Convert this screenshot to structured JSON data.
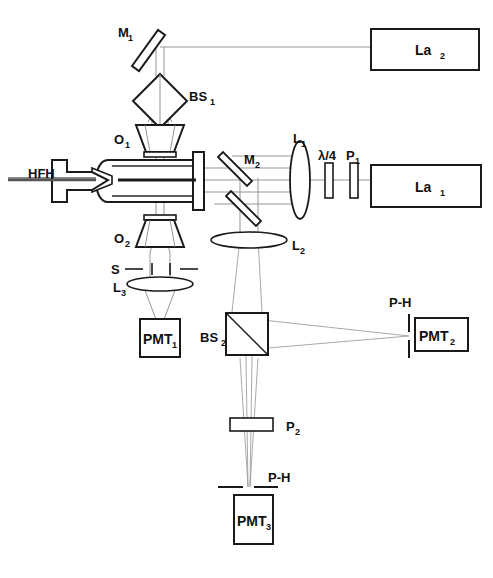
{
  "figure": {
    "type": "optical-schematic",
    "width": 493,
    "height": 578,
    "background_color": "#ffffff",
    "line_color": "#1a1a1a",
    "ray_color": "#9a9a9a"
  },
  "components": {
    "hfh": {
      "label": "HFH",
      "name": "hydrodynamic-focusing-head",
      "label_x": 28,
      "label_y": 178
    },
    "mirror_1": {
      "label": "M",
      "sub": "1",
      "name": "mirror-1",
      "label_x": 118,
      "label_y": 37
    },
    "mirror_2": {
      "label": "M",
      "sub": "2",
      "name": "mirror-2",
      "label_x": 244,
      "label_y": 164
    },
    "beamsplitter_1": {
      "label": "BS",
      "sub": "1",
      "name": "beam-splitter-1",
      "label_x": 189,
      "label_y": 101
    },
    "beamsplitter_2": {
      "label": "BS",
      "sub": "2",
      "name": "beam-splitter-2",
      "label_x": 203,
      "label_y": 342
    },
    "objective_1": {
      "label": "O",
      "sub": "1",
      "name": "objective-1",
      "label_x": 114,
      "label_y": 144
    },
    "objective_2": {
      "label": "O",
      "sub": "2",
      "name": "objective-2",
      "label_x": 114,
      "label_y": 243
    },
    "lens_1": {
      "label": "L",
      "sub": "1",
      "name": "lens-1",
      "label_x": 295,
      "label_y": 143
    },
    "lens_2": {
      "label": "L",
      "sub": "2",
      "name": "lens-2",
      "label_x": 296,
      "label_y": 248
    },
    "lens_3": {
      "label": "L",
      "sub": "3",
      "name": "lens-3",
      "label_x": 116,
      "label_y": 289
    },
    "slit": {
      "label": "S",
      "name": "slit",
      "label_x": 111,
      "label_y": 271
    },
    "quarter_wave_plate": {
      "label": "λ/4",
      "name": "quarter-wave-plate",
      "label_x": 320,
      "label_y": 160
    },
    "polarizer_1": {
      "label": "P",
      "sub": "1",
      "name": "polarizer-1",
      "label_x": 345,
      "label_y": 160
    },
    "polarizer_2": {
      "label": "P",
      "sub": "2",
      "name": "polarizer-2",
      "label_x": 288,
      "label_y": 429
    },
    "pinhole_2": {
      "label": "P-H",
      "name": "pinhole-pmt2",
      "label_x": 390,
      "label_y": 307
    },
    "pinhole_3": {
      "label": "P-H",
      "name": "pinhole-pmt3",
      "label_x": 270,
      "label_y": 482
    }
  },
  "boxes": {
    "laser_2": {
      "label": "La",
      "sub": "2",
      "name": "laser-2",
      "x": 371,
      "y": 29,
      "w": 108,
      "h": 41
    },
    "laser_1": {
      "label": "La",
      "sub": "1",
      "name": "laser-1",
      "x": 371,
      "y": 165,
      "w": 110,
      "h": 42
    },
    "pmt_1": {
      "label": "PMT",
      "sub": "1",
      "name": "photomultiplier-1",
      "x": 140,
      "y": 319,
      "w": 40,
      "h": 38
    },
    "pmt_2": {
      "label": "PMT",
      "sub": "2",
      "name": "photomultiplier-2",
      "x": 415,
      "y": 318,
      "w": 53,
      "h": 33
    },
    "pmt_3": {
      "label": "PMT",
      "sub": "3",
      "name": "photomultiplier-3",
      "x": 234,
      "y": 495,
      "w": 39,
      "h": 49
    }
  },
  "axes": {
    "horizontal_optical_axis_y": 180,
    "vertical_optical_axis_x": 160,
    "detection_axis_x": 246
  }
}
